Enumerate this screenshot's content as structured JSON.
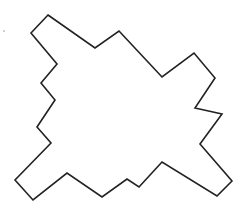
{
  "figure": {
    "type": "irregular-polygon-outline",
    "stroke_color": "#222222",
    "fill_color": "#ffffff",
    "stroke_width": 1.6,
    "vertices": [
      [
        48,
        15
      ],
      [
        95,
        48
      ],
      [
        119,
        31
      ],
      [
        162,
        77
      ],
      [
        194,
        53
      ],
      [
        215,
        78
      ],
      [
        195,
        108
      ],
      [
        222,
        114
      ],
      [
        200,
        144
      ],
      [
        232,
        181
      ],
      [
        217,
        196
      ],
      [
        162,
        162
      ],
      [
        139,
        187
      ],
      [
        127,
        179
      ],
      [
        102,
        197
      ],
      [
        67,
        173
      ],
      [
        33,
        200
      ],
      [
        15,
        180
      ],
      [
        51,
        143
      ],
      [
        37,
        127
      ],
      [
        55,
        100
      ],
      [
        41,
        83
      ],
      [
        57,
        64
      ],
      [
        31,
        33
      ]
    ]
  },
  "marks": {
    "dot": {
      "x": 4,
      "y": 31,
      "color": "#bbbbbb"
    }
  }
}
